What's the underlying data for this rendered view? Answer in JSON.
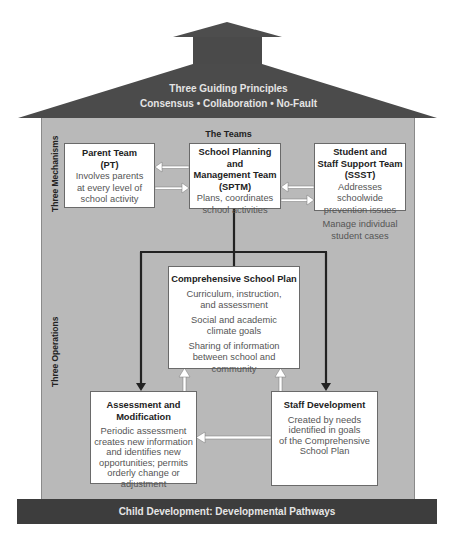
{
  "roof": {
    "title": "Three Guiding Principles",
    "principles": "Consensus • Collaboration • No-Fault",
    "color": "#4a4a4a"
  },
  "body": {
    "section_header": "The Teams",
    "side_labels": {
      "mechanisms": "Three Mechanisms",
      "operations": "Three Operations"
    },
    "background_color": "#b9b9b9"
  },
  "mechanisms": [
    {
      "title_lines": [
        "Parent Team",
        "(PT)"
      ],
      "desc_lines": [
        "Involves parents",
        "at every level of",
        "school activity"
      ]
    },
    {
      "title_lines": [
        "School Planning",
        "and",
        "Management Team",
        "(SPTM)"
      ],
      "desc_lines": [
        "Plans, coordinates",
        "school activities"
      ]
    },
    {
      "title_lines": [
        "Student and",
        "Staff Support Team",
        "(SSST)"
      ],
      "desc_groups": [
        [
          "Addresses schoolwide",
          "prevention issues"
        ],
        [
          "Manage individual",
          "student cases"
        ]
      ]
    }
  ],
  "operations": {
    "plan": {
      "title": "Comprehensive School Plan",
      "items": [
        [
          "Curriculum, instruction,",
          "and assessment"
        ],
        [
          "Social and academic",
          "climate goals"
        ],
        [
          "Sharing of information",
          "between school and",
          "community"
        ]
      ]
    },
    "assessment": {
      "title_lines": [
        "Assessment and",
        "Modification"
      ],
      "desc_lines": [
        "Periodic assessment",
        "creates new information",
        "and identifies new",
        "opportunities; permits",
        "orderly change or",
        "adjustment"
      ]
    },
    "staff": {
      "title": "Staff Development",
      "desc_lines": [
        "Created by needs",
        "identified in goals",
        "of the Comprehensive",
        "School Plan"
      ]
    }
  },
  "foundation": {
    "label": "Child Development: Developmental Pathways",
    "color": "#3d3d3d"
  }
}
